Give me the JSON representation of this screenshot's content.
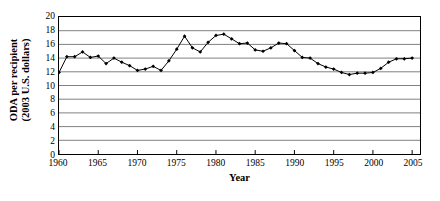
{
  "chart_data": {
    "type": "line",
    "title": "",
    "xlabel": "Year",
    "ylabel": "ODA per recipient (2003 U.S. dollars)",
    "ylabel_line1": "ODA per recipient",
    "ylabel_line2": "(2003 U.S. dollars)",
    "xlim": [
      1960,
      2006
    ],
    "ylim": [
      0,
      20
    ],
    "grid": "horizontal",
    "legend": "none",
    "marker": "filled-diamond",
    "line_color": "#000000",
    "grid_color": "#808080",
    "axis_color": "#000000",
    "yticks": [
      0,
      2,
      4,
      6,
      8,
      10,
      12,
      14,
      16,
      18,
      20
    ],
    "xticks": [
      1960,
      1965,
      1970,
      1975,
      1980,
      1985,
      1990,
      1995,
      2000,
      2005
    ],
    "x": [
      1960,
      1961,
      1962,
      1963,
      1964,
      1965,
      1966,
      1967,
      1968,
      1969,
      1970,
      1971,
      1972,
      1973,
      1974,
      1975,
      1976,
      1977,
      1978,
      1979,
      1980,
      1981,
      1982,
      1983,
      1984,
      1985,
      1986,
      1987,
      1988,
      1989,
      1990,
      1991,
      1992,
      1993,
      1994,
      1995,
      1996,
      1997,
      1998,
      1999,
      2000,
      2001,
      2002,
      2003,
      2004,
      2005
    ],
    "values": [
      11.9,
      14.2,
      14.2,
      14.9,
      14.1,
      14.3,
      13.2,
      14.0,
      13.4,
      12.9,
      12.2,
      12.4,
      12.8,
      12.2,
      13.6,
      15.3,
      17.2,
      15.5,
      14.9,
      16.3,
      17.3,
      17.5,
      16.8,
      16.1,
      16.2,
      15.2,
      15.0,
      15.5,
      16.2,
      16.1,
      15.1,
      14.1,
      14.0,
      13.2,
      12.7,
      12.4,
      11.9,
      11.6,
      11.8,
      11.8,
      11.9,
      12.5,
      13.4,
      13.9,
      13.9,
      14.0
    ],
    "series": [
      {
        "name": "ODA per recipient",
        "values": [
          11.9,
          14.2,
          14.2,
          14.9,
          14.1,
          14.3,
          13.2,
          14.0,
          13.4,
          12.9,
          12.2,
          12.4,
          12.8,
          12.2,
          13.6,
          15.3,
          17.2,
          15.5,
          14.9,
          16.3,
          17.3,
          17.5,
          16.8,
          16.1,
          16.2,
          15.2,
          15.0,
          15.5,
          16.2,
          16.1,
          15.1,
          14.1,
          14.0,
          13.2,
          12.7,
          12.4,
          11.9,
          11.6,
          11.8,
          11.8,
          11.9,
          12.5,
          13.4,
          13.9,
          13.9,
          14.0
        ]
      }
    ]
  }
}
